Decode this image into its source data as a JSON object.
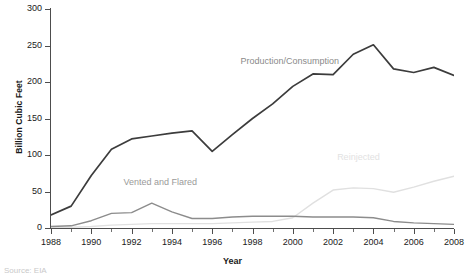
{
  "chart_data": {
    "type": "line",
    "title": "",
    "xlabel": "Year",
    "ylabel": "Billion Cubic Feet",
    "xlim": [
      1988,
      2008
    ],
    "ylim": [
      0,
      300
    ],
    "yticks": [
      0,
      50,
      100,
      150,
      200,
      250,
      300
    ],
    "xticks": [
      1988,
      1990,
      1992,
      1994,
      1996,
      1998,
      2000,
      2002,
      2004,
      2006,
      2008
    ],
    "grid": false,
    "legend": "inline-annotations",
    "x": [
      1988,
      1989,
      1990,
      1991,
      1992,
      1993,
      1994,
      1995,
      1996,
      1997,
      1998,
      1999,
      2000,
      2001,
      2002,
      2003,
      2004,
      2005,
      2006,
      2007,
      2008
    ],
    "series": [
      {
        "name": "Production/Consumption",
        "color": "#3c3c3c",
        "values": [
          18,
          30,
          72,
          108,
          122,
          126,
          130,
          133,
          105,
          128,
          150,
          170,
          194,
          211,
          210,
          238,
          251,
          218,
          213,
          220,
          209
        ]
      },
      {
        "name": "Vented and Flared",
        "color": "#8c8c8c",
        "values": [
          2,
          3,
          10,
          20,
          21,
          34,
          22,
          13,
          13,
          15,
          16,
          16,
          16,
          15,
          15,
          15,
          14,
          9,
          7,
          6,
          5
        ]
      },
      {
        "name": "Reinjected",
        "color": "#e0e0e0",
        "values": [
          0,
          1,
          2,
          4,
          5,
          6,
          6,
          6,
          6,
          7,
          8,
          9,
          14,
          34,
          52,
          55,
          54,
          49,
          56,
          64,
          71
        ]
      }
    ],
    "annotations": [
      {
        "name": "Production/Consumption",
        "x": 1997.4,
        "y": 228
      },
      {
        "name": "Vented and Flared",
        "x": 1991.6,
        "y": 62
      },
      {
        "name": "Reinjected",
        "x": 2002.2,
        "y": 96
      }
    ]
  },
  "footer": {
    "source": "Source: EIA"
  }
}
